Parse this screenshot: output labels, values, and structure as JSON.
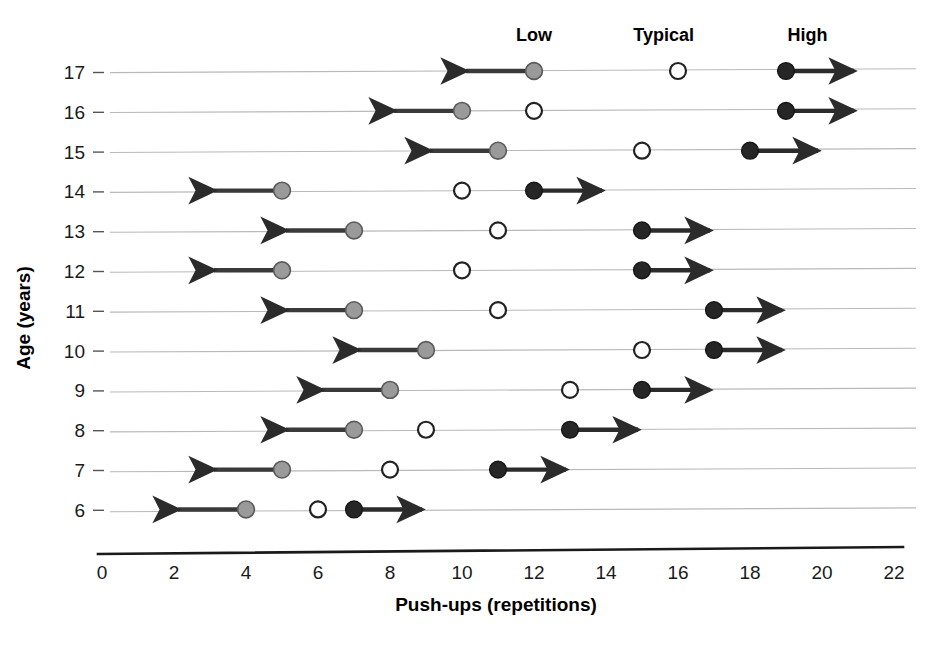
{
  "chart_data": {
    "type": "scatter",
    "title": "",
    "xlabel": "Push-ups (repetitions)",
    "ylabel": "Age (years)",
    "xlim": [
      0,
      22
    ],
    "ylim": [
      5.4,
      17.6
    ],
    "xticks": [
      "0",
      "2",
      "4",
      "6",
      "8",
      "10",
      "12",
      "14",
      "16",
      "18",
      "20",
      "22"
    ],
    "xtick_values": [
      0,
      2,
      4,
      6,
      8,
      10,
      12,
      14,
      16,
      18,
      20,
      22
    ],
    "yticks": [
      "17",
      "16",
      "15",
      "14",
      "13",
      "12",
      "11",
      "10",
      "9",
      "8",
      "7",
      "6"
    ],
    "ytick_values": [
      17,
      16,
      15,
      14,
      13,
      12,
      11,
      10,
      9,
      8,
      7,
      6
    ],
    "grid": true,
    "legend_position": "top",
    "column_headers": [
      {
        "label": "Low",
        "x": 12.0
      },
      {
        "label": "Typical",
        "x": 15.6
      },
      {
        "label": "High",
        "x": 19.6
      }
    ],
    "marker_styles": {
      "low": {
        "name": "gray-filled-circle",
        "fill": "#9a9a9a",
        "stroke": "#5a5a5a",
        "arrow": "left"
      },
      "typical": {
        "name": "open-circle",
        "fill": "#ffffff",
        "stroke": "#222222",
        "arrow": "none"
      },
      "high": {
        "name": "black-filled-circle",
        "fill": "#262626",
        "stroke": "#151515",
        "arrow": "right"
      }
    },
    "series": [
      {
        "name": "Low",
        "key": "low",
        "values": [
          12,
          10,
          11,
          5,
          7,
          5,
          7,
          9,
          8,
          7,
          5,
          4
        ]
      },
      {
        "name": "Typical",
        "key": "typical",
        "values": [
          16,
          12,
          15,
          10,
          11,
          10,
          11,
          15,
          13,
          9,
          8,
          6
        ]
      },
      {
        "name": "High",
        "key": "high",
        "values": [
          19,
          19,
          18,
          12,
          15,
          15,
          17,
          17,
          15,
          13,
          11,
          7
        ]
      }
    ],
    "rows": [
      {
        "age": 17,
        "low": 12,
        "low_arrow_to": 10,
        "typical": 16,
        "high": 19,
        "high_arrow_to": 21
      },
      {
        "age": 16,
        "low": 10,
        "low_arrow_to": 8,
        "typical": 12,
        "high": 19,
        "high_arrow_to": 21
      },
      {
        "age": 15,
        "low": 11,
        "low_arrow_to": 9,
        "typical": 15,
        "high": 18,
        "high_arrow_to": 20
      },
      {
        "age": 14,
        "low": 5,
        "low_arrow_to": 3,
        "typical": 10,
        "high": 12,
        "high_arrow_to": 14
      },
      {
        "age": 13,
        "low": 7,
        "low_arrow_to": 5,
        "typical": 11,
        "high": 15,
        "high_arrow_to": 17
      },
      {
        "age": 12,
        "low": 5,
        "low_arrow_to": 3,
        "typical": 10,
        "high": 15,
        "high_arrow_to": 17
      },
      {
        "age": 11,
        "low": 7,
        "low_arrow_to": 5,
        "typical": 11,
        "high": 17,
        "high_arrow_to": 19
      },
      {
        "age": 10,
        "low": 9,
        "low_arrow_to": 7,
        "typical": 15,
        "high": 17,
        "high_arrow_to": 19
      },
      {
        "age": 9,
        "low": 8,
        "low_arrow_to": 6,
        "typical": 13,
        "high": 15,
        "high_arrow_to": 17
      },
      {
        "age": 8,
        "low": 7,
        "low_arrow_to": 5,
        "typical": 9,
        "high": 13,
        "high_arrow_to": 15
      },
      {
        "age": 7,
        "low": 5,
        "low_arrow_to": 3,
        "typical": 8,
        "high": 11,
        "high_arrow_to": 13
      },
      {
        "age": 6,
        "low": 4,
        "low_arrow_to": 2,
        "typical": 6,
        "high": 7,
        "high_arrow_to": 9
      }
    ]
  }
}
